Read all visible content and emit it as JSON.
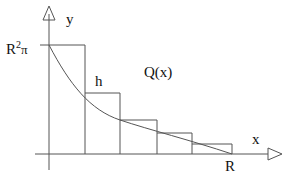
{
  "labels": {
    "y_axis": "y",
    "x_axis": "x",
    "y_max_base": "R",
    "y_max_exp": "2",
    "y_max_pi": "π",
    "step": "h",
    "curve": "Q(x)",
    "x_end": "R"
  },
  "colors": {
    "stroke": "#555555",
    "text": "#111111"
  },
  "rects": [
    {
      "x0": 49,
      "x1": 85,
      "top": 45
    },
    {
      "x0": 85,
      "x1": 120,
      "top": 93
    },
    {
      "x0": 120,
      "x1": 157,
      "top": 120
    },
    {
      "x0": 157,
      "x1": 192,
      "top": 133
    },
    {
      "x0": 192,
      "x1": 232,
      "top": 144
    }
  ]
}
